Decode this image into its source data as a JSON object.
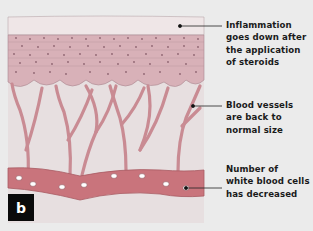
{
  "figure": {
    "panel_letter": "b",
    "colors": {
      "background": "#ebebeb",
      "epidermis": "#efe3e4",
      "cell_layer": "#d9a9b2",
      "cell_nucleus": "#9a6a76",
      "blood_vessel": "#c9727a",
      "white_blood_cell": "#ffffff",
      "leader_line": "#222222"
    },
    "labels": [
      {
        "id": "inflammation",
        "lines": [
          "Inflammation",
          "goes down after",
          "the application",
          "of steroids"
        ]
      },
      {
        "id": "blood-vessels",
        "lines": [
          "Blood vessels",
          "are back to",
          "normal size"
        ]
      },
      {
        "id": "white-blood-cells",
        "lines": [
          "Number of",
          "white blood cells",
          "has decreased"
        ]
      }
    ]
  }
}
